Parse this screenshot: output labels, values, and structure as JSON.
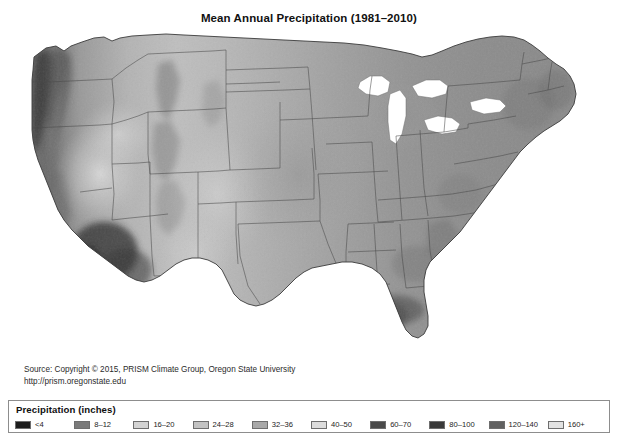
{
  "figure": {
    "title": "Mean Annual Precipitation (1981–2010)",
    "background_color": "#ffffff"
  },
  "source": {
    "line1": "Source: Copyright © 2015, PRISM Climate Group, Oregon State University",
    "line2": "http://prism.oregonstate.edu"
  },
  "legend": {
    "title": "Precipitation (inches)",
    "border_color": "#8d8d8d",
    "items": [
      {
        "label": "<4",
        "color": "#1d1d1d"
      },
      {
        "label": "8–12",
        "color": "#7a7a7a"
      },
      {
        "label": "16–20",
        "color": "#d3d3d3"
      },
      {
        "label": "24–28",
        "color": "#c2c2c2"
      },
      {
        "label": "32–36",
        "color": "#a8a8a8"
      },
      {
        "label": "40–50",
        "color": "#dcdcdc"
      },
      {
        "label": "60–70",
        "color": "#4a4a4a"
      },
      {
        "label": "80–100",
        "color": "#3a3a3a"
      },
      {
        "label": "120–140",
        "color": "#616161"
      },
      {
        "label": "160+",
        "color": "#e2e2e2"
      }
    ]
  },
  "chart_data": {
    "type": "heatmap",
    "title": "Mean Annual Precipitation (1981–2010)",
    "subtitle": "",
    "xlabel": "",
    "ylabel": "",
    "region": "Contiguous United States",
    "variable": "Mean annual precipitation",
    "units": "inches",
    "period": "1981–2010",
    "colormap": "grayscale",
    "grid": false,
    "legend_position": "bottom",
    "legend_title": "Precipitation (inches)",
    "class_breaks": [
      "<4",
      "8–12",
      "16–20",
      "24–28",
      "32–36",
      "40–50",
      "60–70",
      "80–100",
      "120–140",
      "160+"
    ],
    "class_colors": [
      "#1d1d1d",
      "#7a7a7a",
      "#d3d3d3",
      "#c2c2c2",
      "#a8a8a8",
      "#dcdcdc",
      "#4a4a4a",
      "#3a3a3a",
      "#616161",
      "#e2e2e2"
    ],
    "regional_values": [
      {
        "region": "Pacific Northwest coast",
        "class": "160+",
        "shade": "#3f3f3f"
      },
      {
        "region": "Cascade Range",
        "class": "80–100",
        "shade": "#4e4e4e"
      },
      {
        "region": "Northern California coast",
        "class": "60–70",
        "shade": "#5a5a5a"
      },
      {
        "region": "Sierra Nevada",
        "class": "40–50",
        "shade": "#6a6a6a"
      },
      {
        "region": "Great Basin / Nevada",
        "class": "8–12",
        "shade": "#b9b9b9"
      },
      {
        "region": "Desert Southwest",
        "class": "<4",
        "shade": "#2a2a2a"
      },
      {
        "region": "Rocky Mountains",
        "class": "24–28",
        "shade": "#8f8f8f"
      },
      {
        "region": "High Plains",
        "class": "16–20",
        "shade": "#b3b3b3"
      },
      {
        "region": "Central Plains",
        "class": "32–36",
        "shade": "#a2a2a2"
      },
      {
        "region": "Midwest / Great Lakes",
        "class": "32–36",
        "shade": "#9a9a9a"
      },
      {
        "region": "Ohio Valley",
        "class": "40–50",
        "shade": "#8a8a8a"
      },
      {
        "region": "Appalachians",
        "class": "40–50",
        "shade": "#808080"
      },
      {
        "region": "Northeast",
        "class": "40–50",
        "shade": "#909090"
      },
      {
        "region": "Gulf Coast / Louisiana",
        "class": "60–70",
        "shade": "#4d4d4d"
      },
      {
        "region": "Florida",
        "class": "40–50",
        "shade": "#9e9e9e"
      },
      {
        "region": "West Texas",
        "class": "8–12",
        "shade": "#bdbdbd"
      },
      {
        "region": "East Texas",
        "class": "40–50",
        "shade": "#8c8c8c"
      }
    ]
  }
}
